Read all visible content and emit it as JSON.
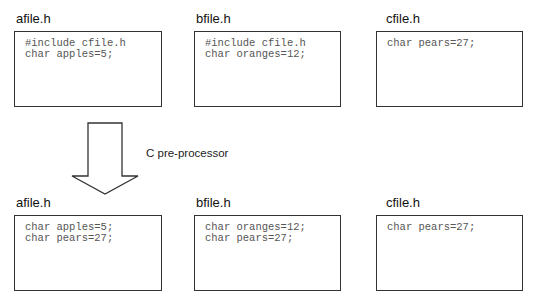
{
  "before": {
    "files": [
      {
        "title": "afile.h",
        "lines": [
          "#include cfile.h",
          "char apples=5;"
        ]
      },
      {
        "title": "bfile.h",
        "lines": [
          "#include cfile.h",
          "char oranges=12;"
        ]
      },
      {
        "title": "cfile.h",
        "lines": [
          "char pears=27;",
          ""
        ]
      }
    ]
  },
  "process": {
    "label": "C pre-processor",
    "icon": "down-arrow-icon"
  },
  "after": {
    "files": [
      {
        "title": "afile.h",
        "lines": [
          "char apples=5;",
          "char pears=27;"
        ]
      },
      {
        "title": "bfile.h",
        "lines": [
          "char oranges=12;",
          "char pears=27;"
        ]
      },
      {
        "title": "cfile.h",
        "lines": [
          "char pears=27;",
          ""
        ]
      }
    ]
  }
}
